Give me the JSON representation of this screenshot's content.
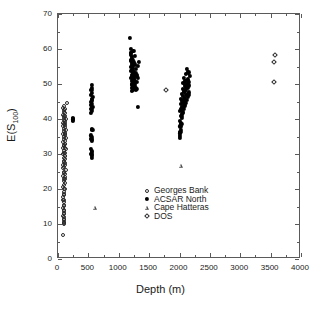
{
  "chart_data": {
    "type": "scatter",
    "title": "",
    "xlabel": "Depth (m)",
    "ylabel": "E(S100)",
    "ylabel_base": "E(S",
    "ylabel_sub": "100",
    "ylabel_close": ")",
    "xlim": [
      0,
      4000
    ],
    "ylim": [
      0,
      70
    ],
    "xticks": [
      0,
      500,
      1000,
      1500,
      2000,
      2500,
      3000,
      3500,
      4000
    ],
    "yticks": [
      0,
      10,
      20,
      30,
      40,
      50,
      60,
      70
    ],
    "xtick_labels": [
      "0",
      "500",
      "1000",
      "1500",
      "2000",
      "2500",
      "3000",
      "3500",
      "4000"
    ],
    "ytick_labels": [
      "0",
      "10",
      "20",
      "30",
      "40",
      "50",
      "60",
      "70"
    ],
    "grid": false,
    "legend_position": "lower-right",
    "frame": "box-all-sides-inward-ticks",
    "series": [
      {
        "name": "Georges Bank",
        "marker": "open-circle",
        "color": "#2a2a2a",
        "points": [
          [
            80,
            6.8
          ],
          [
            95,
            10.3
          ],
          [
            96,
            11.2
          ],
          [
            97,
            12.0
          ],
          [
            98,
            12.8
          ],
          [
            99,
            13.6
          ],
          [
            88,
            14.6
          ],
          [
            101,
            15.4
          ],
          [
            92,
            16.2
          ],
          [
            103,
            17.0
          ],
          [
            85,
            17.8
          ],
          [
            105,
            18.5
          ],
          [
            95,
            19.2
          ],
          [
            110,
            19.9
          ],
          [
            88,
            20.5
          ],
          [
            100,
            21.2
          ],
          [
            118,
            21.8
          ],
          [
            92,
            22.4
          ],
          [
            106,
            23.0
          ],
          [
            83,
            23.6
          ],
          [
            112,
            24.2
          ],
          [
            97,
            24.8
          ],
          [
            128,
            25.3
          ],
          [
            90,
            25.9
          ],
          [
            104,
            26.4
          ],
          [
            86,
            27.0
          ],
          [
            116,
            27.5
          ],
          [
            99,
            28.0
          ],
          [
            122,
            28.5
          ],
          [
            93,
            29.0
          ],
          [
            108,
            29.5
          ],
          [
            85,
            30.0
          ],
          [
            114,
            30.4
          ],
          [
            101,
            30.9
          ],
          [
            126,
            31.3
          ],
          [
            89,
            31.8
          ],
          [
            105,
            32.2
          ],
          [
            95,
            32.6
          ],
          [
            119,
            33.0
          ],
          [
            83,
            33.4
          ],
          [
            110,
            33.8
          ],
          [
            98,
            34.2
          ],
          [
            124,
            34.6
          ],
          [
            91,
            35.0
          ],
          [
            107,
            35.4
          ],
          [
            86,
            35.8
          ],
          [
            115,
            36.1
          ],
          [
            100,
            36.5
          ],
          [
            130,
            36.9
          ],
          [
            94,
            37.2
          ],
          [
            109,
            37.6
          ],
          [
            84,
            37.9
          ],
          [
            120,
            38.3
          ],
          [
            102,
            38.6
          ],
          [
            88,
            39.0
          ],
          [
            112,
            39.3
          ],
          [
            97,
            39.7
          ],
          [
            128,
            40.0
          ],
          [
            92,
            40.4
          ],
          [
            106,
            40.8
          ],
          [
            86,
            41.2
          ],
          [
            118,
            41.6
          ],
          [
            101,
            42.0
          ],
          [
            95,
            42.5
          ],
          [
            110,
            43.0
          ],
          [
            78,
            43.2
          ],
          [
            140,
            44.6
          ],
          [
            105,
            13.1
          ],
          [
            104,
            11.5
          ],
          [
            103,
            10.6
          ],
          [
            102,
            9.9
          ],
          [
            116,
            22.9
          ],
          [
            121,
            26.8
          ],
          [
            109,
            31.6
          ],
          [
            113,
            35.6
          ],
          [
            99,
            20.1
          ],
          [
            91,
            18.2
          ],
          [
            87,
            16.8
          ],
          [
            106,
            15.2
          ],
          [
            96,
            30.2
          ],
          [
            100,
            27.8
          ],
          [
            94,
            24.5
          ],
          [
            108,
            23.4
          ],
          [
            118,
            29.3
          ],
          [
            111,
            32.9
          ],
          [
            123,
            38.9
          ],
          [
            115,
            41.0
          ],
          [
            103,
            43.6
          ],
          [
            90,
            12.4
          ],
          [
            93,
            14.0
          ]
        ]
      },
      {
        "name": "ACSAR North",
        "marker": "filled-circle",
        "color": "#000000",
        "points": [
          [
            245,
            39.5
          ],
          [
            248,
            40.1
          ],
          [
            250,
            40.4
          ],
          [
            243,
            39.9
          ],
          [
            552,
            29.0
          ],
          [
            556,
            29.6
          ],
          [
            549,
            30.1
          ],
          [
            560,
            30.5
          ],
          [
            554,
            31.0
          ],
          [
            547,
            31.4
          ],
          [
            562,
            33.9
          ],
          [
            551,
            34.4
          ],
          [
            558,
            34.9
          ],
          [
            545,
            35.3
          ],
          [
            565,
            36.9
          ],
          [
            553,
            37.2
          ],
          [
            548,
            41.8
          ],
          [
            560,
            42.4
          ],
          [
            550,
            43.0
          ],
          [
            566,
            43.5
          ],
          [
            543,
            44.0
          ],
          [
            557,
            44.4
          ],
          [
            547,
            44.9
          ],
          [
            562,
            45.3
          ],
          [
            552,
            45.8
          ],
          [
            568,
            46.3
          ],
          [
            545,
            46.9
          ],
          [
            559,
            47.5
          ],
          [
            550,
            48.2
          ],
          [
            563,
            49.0
          ],
          [
            555,
            49.8
          ],
          [
            1190,
            63.2
          ],
          [
            1200,
            60.0
          ],
          [
            1205,
            59.0
          ],
          [
            1195,
            58.4
          ],
          [
            1210,
            57.8
          ],
          [
            1220,
            57.2
          ],
          [
            1198,
            56.6
          ],
          [
            1232,
            56.8
          ],
          [
            1215,
            56.0
          ],
          [
            1245,
            56.4
          ],
          [
            1225,
            55.4
          ],
          [
            1208,
            55.0
          ],
          [
            1260,
            55.6
          ],
          [
            1238,
            54.6
          ],
          [
            1218,
            54.1
          ],
          [
            1202,
            53.8
          ],
          [
            1280,
            54.2
          ],
          [
            1250,
            53.4
          ],
          [
            1230,
            53.0
          ],
          [
            1212,
            52.7
          ],
          [
            1265,
            52.9
          ],
          [
            1242,
            52.3
          ],
          [
            1222,
            52.0
          ],
          [
            1206,
            51.7
          ],
          [
            1290,
            52.2
          ],
          [
            1255,
            51.4
          ],
          [
            1235,
            51.1
          ],
          [
            1216,
            50.8
          ],
          [
            1270,
            51.0
          ],
          [
            1248,
            50.4
          ],
          [
            1226,
            50.1
          ],
          [
            1210,
            49.8
          ],
          [
            1300,
            50.6
          ],
          [
            1258,
            49.5
          ],
          [
            1238,
            49.2
          ],
          [
            1220,
            48.9
          ],
          [
            1275,
            49.0
          ],
          [
            1252,
            48.5
          ],
          [
            1232,
            48.3
          ],
          [
            1214,
            48.1
          ],
          [
            1310,
            51.8
          ],
          [
            1320,
            55.2
          ],
          [
            1330,
            56.2
          ],
          [
            1296,
            48.6
          ],
          [
            1285,
            48.2
          ],
          [
            1268,
            50.0
          ],
          [
            1244,
            51.6
          ],
          [
            1228,
            53.6
          ],
          [
            1204,
            58.8
          ],
          [
            1199,
            57.0
          ],
          [
            1312,
            43.4
          ],
          [
            1240,
            59.4
          ],
          [
            1260,
            58.0
          ],
          [
            1284,
            53.2
          ],
          [
            1302,
            52.5
          ],
          [
            2000,
            34.6
          ],
          [
            2010,
            35.2
          ],
          [
            2005,
            35.9
          ],
          [
            2020,
            37.0
          ],
          [
            2015,
            37.9
          ],
          [
            2030,
            38.6
          ],
          [
            2008,
            39.4
          ],
          [
            2040,
            40.2
          ],
          [
            2025,
            41.0
          ],
          [
            2055,
            41.7
          ],
          [
            2012,
            42.3
          ],
          [
            2070,
            42.9
          ],
          [
            2035,
            43.4
          ],
          [
            2085,
            43.9
          ],
          [
            2018,
            44.3
          ],
          [
            2100,
            44.7
          ],
          [
            2048,
            45.1
          ],
          [
            2120,
            45.4
          ],
          [
            2028,
            45.8
          ],
          [
            2135,
            46.2
          ],
          [
            2062,
            46.5
          ],
          [
            2150,
            46.9
          ],
          [
            2040,
            47.2
          ],
          [
            2160,
            47.6
          ],
          [
            2075,
            48.0
          ],
          [
            2110,
            48.3
          ],
          [
            2052,
            48.7
          ],
          [
            2145,
            49.0
          ],
          [
            2088,
            49.4
          ],
          [
            2125,
            49.8
          ],
          [
            2065,
            50.2
          ],
          [
            2155,
            50.5
          ],
          [
            2098,
            50.9
          ],
          [
            2138,
            51.3
          ],
          [
            2078,
            51.8
          ],
          [
            2165,
            52.3
          ],
          [
            2108,
            52.8
          ],
          [
            2148,
            53.3
          ],
          [
            2122,
            54.4
          ],
          [
            2090,
            46.0
          ],
          [
            2058,
            44.5
          ],
          [
            2032,
            43.0
          ],
          [
            2044,
            40.8
          ],
          [
            2022,
            39.0
          ],
          [
            2068,
            45.6
          ],
          [
            2082,
            47.8
          ],
          [
            2104,
            48.9
          ],
          [
            2130,
            50.0
          ],
          [
            2142,
            51.0
          ],
          [
            2095,
            45.0
          ],
          [
            2050,
            42.0
          ],
          [
            2016,
            36.4
          ],
          [
            2114,
            47.0
          ],
          [
            2158,
            49.6
          ],
          [
            2072,
            43.7
          ],
          [
            2036,
            41.4
          ]
        ]
      },
      {
        "name": "Cape Hatteras",
        "marker": "open-triangle",
        "color": "#4a4a4a",
        "points": [
          [
            608,
            14.7
          ],
          [
            2025,
            26.6
          ]
        ]
      },
      {
        "name": "DOS",
        "marker": "open-diamond",
        "color": "#2a2a2a",
        "points": [
          [
            1780,
            48.3
          ],
          [
            3565,
            58.4
          ],
          [
            3560,
            56.4
          ],
          [
            3558,
            50.5
          ]
        ]
      }
    ]
  },
  "legend": {
    "entries": [
      {
        "label": "Georges Bank",
        "marker": "open-circle"
      },
      {
        "label": "ACSAR North",
        "marker": "filled-circle"
      },
      {
        "label": "Cape Hatteras",
        "marker": "open-triangle"
      },
      {
        "label": "DOS",
        "marker": "open-diamond"
      }
    ]
  }
}
